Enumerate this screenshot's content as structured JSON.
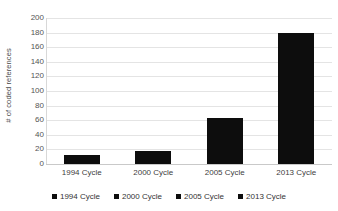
{
  "chart_data": {
    "type": "bar",
    "title": "",
    "subtitle": "",
    "xlabel": "",
    "ylabel": "# of coded references",
    "categories": [
      "1994 Cycle",
      "2000 Cycle",
      "2005 Cycle",
      "2013 Cycle"
    ],
    "values": [
      13,
      18,
      63,
      180
    ],
    "series": [
      {
        "name": "coded references",
        "values": [
          13,
          18,
          63,
          180
        ]
      }
    ],
    "ylim": [
      0,
      200
    ],
    "y_ticks": [
      0,
      20,
      40,
      60,
      80,
      100,
      120,
      140,
      160,
      180,
      200
    ],
    "y_tick_labels": [
      "0",
      "20",
      "40",
      "60",
      "80",
      "100",
      "120",
      "140",
      "160",
      "180",
      "200"
    ],
    "grid": "horizontal",
    "legend_position": "bottom",
    "legend": [
      {
        "label": "1994 Cycle",
        "color": "#0d0d0d",
        "marker": "square"
      },
      {
        "label": "2000 Cycle",
        "color": "#0d0d0d",
        "marker": "square"
      },
      {
        "label": "2005 Cycle",
        "color": "#0d0d0d",
        "marker": "square"
      },
      {
        "label": "2013 Cycle",
        "color": "#0d0d0d",
        "marker": "square"
      }
    ],
    "colors": {
      "bar": "#0d0d0d",
      "gridline": "#e4e4e4",
      "axis": "#c9c9c9",
      "text": "#404040",
      "background": "#ffffff"
    }
  }
}
